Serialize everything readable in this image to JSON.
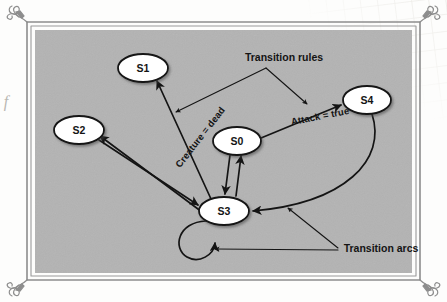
{
  "figure": {
    "kind": "state-machine-diagram",
    "panel_color": "#b3b3b3",
    "page_color": "#fdfdfc",
    "frame_color": "#8a8a8a",
    "ink_color": "#141414",
    "node_fill": "#ffffff",
    "margin_glyph": "f"
  },
  "nodes": [
    {
      "id": "S0",
      "label": "S0",
      "cx": 237,
      "cy": 141,
      "rx": 24,
      "ry": 14
    },
    {
      "id": "S1",
      "label": "S1",
      "cx": 143,
      "cy": 68,
      "rx": 25,
      "ry": 14
    },
    {
      "id": "S2",
      "label": "S2",
      "cx": 79,
      "cy": 130,
      "rx": 25,
      "ry": 14
    },
    {
      "id": "S3",
      "label": "S3",
      "cx": 224,
      "cy": 211,
      "rx": 25,
      "ry": 14
    },
    {
      "id": "S4",
      "label": "S4",
      "cx": 367,
      "cy": 100,
      "rx": 24,
      "ry": 14
    }
  ],
  "edges": [
    {
      "name": "s3-to-s1",
      "from": "S3",
      "to": "S1",
      "label": "Creature = dead"
    },
    {
      "name": "s0-to-s4",
      "from": "S0",
      "to": "S4",
      "label": "Attack = true"
    },
    {
      "name": "s3-to-s2",
      "from": "S3",
      "to": "S2",
      "label": ""
    },
    {
      "name": "s2-to-s3",
      "from": "S2",
      "to": "S3",
      "label": ""
    },
    {
      "name": "s0-to-s3",
      "from": "S0",
      "to": "S3",
      "label": ""
    },
    {
      "name": "s3-to-s0",
      "from": "S3",
      "to": "S0",
      "label": ""
    },
    {
      "name": "s4-to-s3",
      "from": "S4",
      "to": "S3",
      "label": ""
    },
    {
      "name": "s3-self-loop",
      "from": "S3",
      "to": "S3",
      "label": ""
    }
  ],
  "edge_labels": {
    "creature_dead": {
      "text": "Creature = dead",
      "x": 200,
      "y": 137,
      "rotate": -52
    },
    "attack_true": {
      "text": "Attack = true",
      "x": 320,
      "y": 116,
      "rotate": -11
    }
  },
  "annotations": [
    {
      "name": "transition-rules",
      "text": "Transition rules",
      "x": 284,
      "y": 57,
      "targets": [
        "creature-dead-label",
        "attack-true-label"
      ]
    },
    {
      "name": "transition-arcs",
      "text": "Transition arcs",
      "x": 381,
      "y": 248,
      "targets": [
        "s4-to-s3-arc",
        "s3-self-loop-arc"
      ]
    }
  ]
}
